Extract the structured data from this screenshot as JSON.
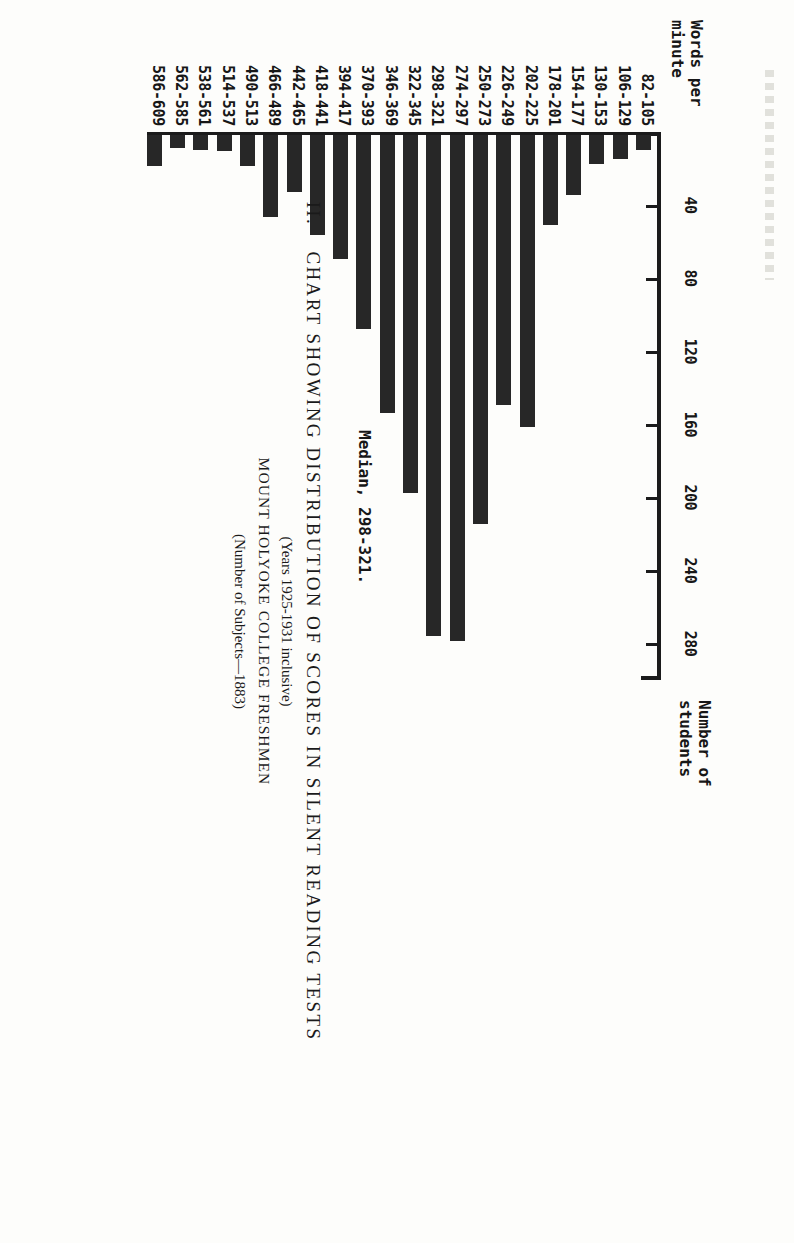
{
  "plate": {
    "number": "II.",
    "title": "CHART SHOWING DISTRIBUTION OF SCORES IN SILENT READING TESTS",
    "subtitle_years": "(Years 1925-1931 inclusive)",
    "subtitle_institution": "MOUNT HOLYOKE COLLEGE FRESHMEN",
    "subtitle_subjects": "(Number of Subjects—1883)"
  },
  "annotation": {
    "median_label": "Median, 298-321."
  },
  "chart_data": {
    "type": "bar",
    "orientation": "horizontal",
    "title": "CHART SHOWING DISTRIBUTION OF SCORES IN SILENT READING TESTS",
    "xlabel": "Number of\nstudents",
    "ylabel": "Words per\nminute",
    "xlim": [
      0,
      300
    ],
    "xticks": [
      40,
      80,
      120,
      160,
      200,
      240,
      280
    ],
    "xticklabels": [
      "40",
      "80",
      "120",
      "160",
      "200",
      "240",
      "280"
    ],
    "grid": false,
    "legend": null,
    "bar_color": "#272727",
    "categories": [
      "82-105",
      "106-129",
      "130-153",
      "154-177",
      "178-201",
      "202-225",
      "226-249",
      "250-273",
      "274-297",
      "298-321",
      "322-345",
      "346-369",
      "370-393",
      "394-417",
      "418-441",
      "442-465",
      "466-489",
      "490-513",
      "514-537",
      "538-561",
      "562-585",
      "586-609"
    ],
    "values": [
      8,
      13,
      16,
      33,
      49,
      160,
      148,
      213,
      277,
      274,
      196,
      152,
      106,
      68,
      55,
      31,
      45,
      17,
      9,
      8,
      7,
      17
    ],
    "annotations": [
      {
        "text": "Median, 298-321.",
        "category": "298-321"
      }
    ]
  }
}
